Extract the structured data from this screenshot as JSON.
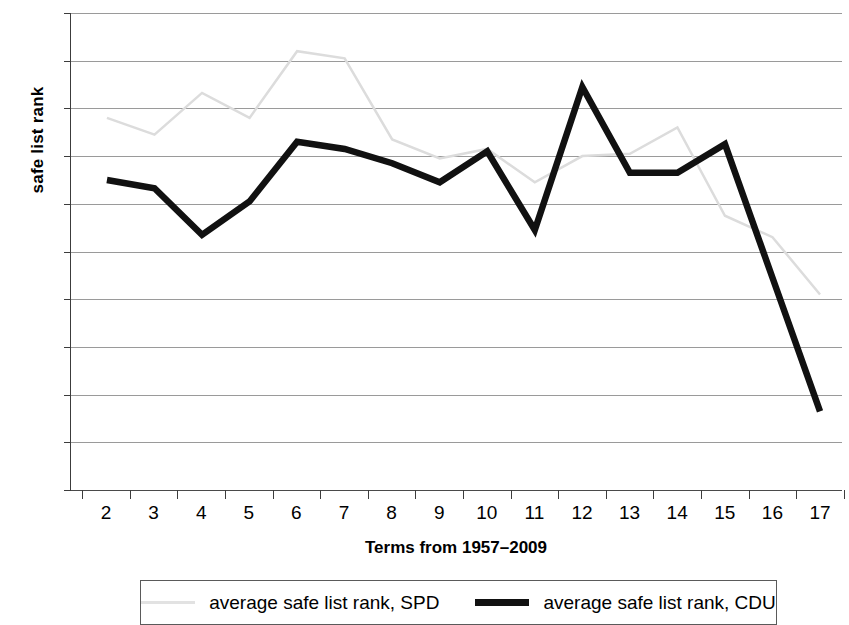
{
  "chart_data": {
    "type": "line",
    "title": "",
    "xlabel": "Terms from 1957–2009",
    "ylabel": "safe list rank",
    "xlim": [
      2,
      17
    ],
    "ylim": [
      0,
      20
    ],
    "grid": true,
    "legend_position": "bottom",
    "x": [
      2,
      3,
      4,
      5,
      6,
      7,
      8,
      9,
      10,
      11,
      12,
      13,
      14,
      15,
      16,
      17
    ],
    "xtick_labels": [
      "2",
      "3",
      "4",
      "5",
      "6",
      "7",
      "8",
      "9",
      "10",
      "11",
      "12",
      "13",
      "14",
      "15",
      "16",
      "17"
    ],
    "ytick_labels": [
      "0",
      "2",
      "4",
      "6",
      "8",
      "10",
      "12",
      "14",
      "16",
      "18",
      "20"
    ],
    "ytick_values": [
      0,
      2,
      4,
      6,
      8,
      10,
      12,
      14,
      16,
      18,
      20
    ],
    "series": [
      {
        "name": "average safe list rank, SPD",
        "color": "#dcdcdc",
        "width": 2.5,
        "values": [
          15.6,
          14.9,
          16.65,
          15.6,
          18.4,
          18.1,
          14.7,
          13.9,
          14.3,
          12.9,
          14.0,
          14.1,
          15.2,
          11.5,
          10.6,
          8.2
        ]
      },
      {
        "name": "average safe list rank, CDU",
        "color": "#111111",
        "width": 6.5,
        "values": [
          13.0,
          12.65,
          10.7,
          12.1,
          14.6,
          14.3,
          13.7,
          12.9,
          14.2,
          10.9,
          16.9,
          13.3,
          13.3,
          14.5,
          8.9,
          3.3
        ]
      }
    ]
  },
  "legend": {
    "entries": [
      {
        "label": "average safe list rank, SPD",
        "marker": "spd-line-swatch"
      },
      {
        "label": "average safe list rank, CDU",
        "marker": "cdu-line-swatch"
      }
    ]
  }
}
